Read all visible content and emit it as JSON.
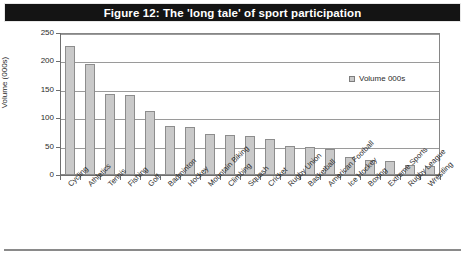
{
  "figure": {
    "title": "Figure 12: The 'long tale' of sport participation",
    "legend_label": "Volume 000s"
  },
  "chart_data": {
    "type": "bar",
    "title": "Figure 12: The 'long tale' of sport participation",
    "xlabel": "",
    "ylabel": "Volume (000s)",
    "ylim": [
      0,
      250
    ],
    "yticks": [
      0,
      50,
      100,
      150,
      200,
      250
    ],
    "grid": true,
    "legend_position": "inside-top-right",
    "series_name": "Volume 000s",
    "bar_color": "#c9c9c9",
    "bar_border_color": "#8d8d8d",
    "categories": [
      "Cycling",
      "Athletics",
      "Tennis",
      "Fishing",
      "Golf",
      "Badminton",
      "Hockey",
      "Mountain Biking",
      "Climbing",
      "Squash",
      "Cricket",
      "Rugby Union",
      "Basketball",
      "American Football",
      "Ice Hockey",
      "Boxing",
      "Extreme Sports",
      "Rugby League",
      "Wrestling"
    ],
    "values": [
      227,
      196,
      142,
      140,
      112,
      87,
      85,
      73,
      70,
      68,
      64,
      51,
      50,
      45,
      31,
      27,
      25,
      17,
      15
    ]
  }
}
